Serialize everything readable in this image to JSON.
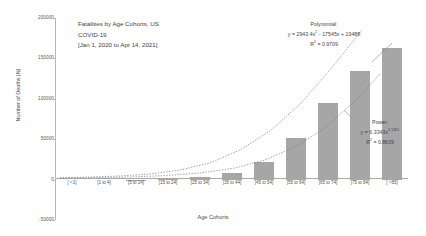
{
  "chart_data": {
    "type": "bar",
    "title": "Fatalities by Age Cohorts, US COVID-19 [Jan 1, 2020 to Apr 14, 2021]",
    "title_lines": [
      "Fatalities by Age Cohorts, US",
      "COVID-19",
      "[Jan 1, 2020 to Apr 14, 2021]"
    ],
    "xlabel": "Age Cohorts",
    "ylabel": "Number of Deaths (N)",
    "categories": [
      "[ <1]",
      "[1 to 4]",
      "[5 to 14]",
      "[15 to 24]",
      "[25 to 34]",
      "[35 to 44]",
      "[45 to 54]",
      "[55 to 64]",
      "[65 to 74]",
      "[75 to 84]",
      "[ >85]"
    ],
    "values": [
      60,
      30,
      120,
      900,
      3000,
      8000,
      22000,
      52000,
      95000,
      135000,
      163000
    ],
    "ylim": [
      -50000,
      200000
    ],
    "ytick_labels": [
      "200000",
      "150000",
      "100000",
      "50000",
      "0",
      "-50000"
    ],
    "ytick_values": [
      200000,
      150000,
      100000,
      50000,
      0,
      -50000
    ],
    "grid": false,
    "legend": "none",
    "bar_color": "#a6a6a6",
    "trendlines": [
      {
        "name": "Polynomial",
        "label": "Polynomial:",
        "equation": "y = 2943.4x² - 17545x + 19488",
        "equation_base": "y = 2943.4x",
        "equation_exp": "2",
        "equation_rest": " - 17545x + 19488",
        "r2_label": "R² = 0.9709",
        "r2_base": "R",
        "r2_exp": "2",
        "r2_rest": " = 0.9709",
        "r2": 0.9709,
        "style": "dotted"
      },
      {
        "name": "Power",
        "label": "Power:",
        "equation": "y = 6.3343x3.1361",
        "equation_base": "y = 6.3343x",
        "equation_exp": "3.1361",
        "equation_rest": "",
        "r2_label": "R² = 0.8639",
        "r2_base": "R",
        "r2_exp": "2",
        "r2_rest": " = 0.8639",
        "r2": 0.8639,
        "style": "dotted"
      }
    ]
  }
}
